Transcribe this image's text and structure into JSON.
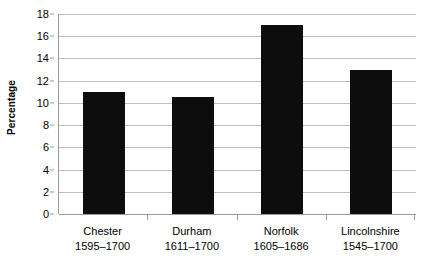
{
  "chart_data": {
    "type": "bar",
    "title": "",
    "xlabel": "",
    "ylabel": "Percentage",
    "ylim": [
      0,
      18
    ],
    "ytick_step": 2,
    "yticks": [
      0,
      2,
      4,
      6,
      8,
      10,
      12,
      14,
      16,
      18
    ],
    "ytick_labels": [
      "0",
      "2",
      "4",
      "6",
      "8",
      "10",
      "12",
      "14",
      "16",
      "18"
    ],
    "grid": true,
    "legend": false,
    "bar_color": "#0d0d0d",
    "gridline_color": "#bdbdbd",
    "axis_color": "#9a9a9a",
    "categories": [
      {
        "name": "Chester",
        "period": "1595–1700",
        "label": "Chester 1595–1700"
      },
      {
        "name": "Durham",
        "period": "1611–1700",
        "label": "Durham 1611–1700"
      },
      {
        "name": "Norfolk",
        "period": "1605–1686",
        "label": "Norfolk 1605–1686"
      },
      {
        "name": "Lincolnshire",
        "period": "1545–1700",
        "label": "Lincolnshire 1545–1700"
      }
    ],
    "values": [
      11,
      10.5,
      17,
      13
    ]
  }
}
